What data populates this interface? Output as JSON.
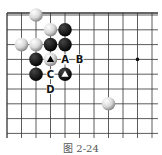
{
  "caption": "图 2-24",
  "board": {
    "origin_x": 7,
    "origin_y": 15,
    "spacing_x": 14.5,
    "spacing_y": 14.8,
    "cols": 11,
    "rows": 9,
    "left_edge": true,
    "top_edge": true,
    "line_color": "#333333",
    "hoshi": [
      {
        "col": 9,
        "row": 3
      }
    ]
  },
  "stones": [
    {
      "color": "white",
      "col": 2,
      "row": 0
    },
    {
      "color": "white",
      "col": 3,
      "row": 1
    },
    {
      "color": "black",
      "col": 4,
      "row": 1
    },
    {
      "color": "white",
      "col": 1,
      "row": 2
    },
    {
      "color": "white",
      "col": 2,
      "row": 2
    },
    {
      "color": "black",
      "col": 3,
      "row": 2
    },
    {
      "color": "black",
      "col": 4,
      "row": 2
    },
    {
      "color": "black",
      "col": 2,
      "row": 3
    },
    {
      "color": "white",
      "col": 3,
      "row": 3,
      "mark": "triangle"
    },
    {
      "color": "black",
      "col": 2,
      "row": 4
    },
    {
      "color": "black",
      "col": 4,
      "row": 4,
      "mark": "triangle"
    },
    {
      "color": "white",
      "col": 7,
      "row": 6
    }
  ],
  "labels": [
    {
      "text": "A",
      "col": 4,
      "row": 3
    },
    {
      "text": "B",
      "col": 5,
      "row": 3
    },
    {
      "text": "C",
      "col": 3,
      "row": 4
    },
    {
      "text": "D",
      "col": 3,
      "row": 5
    }
  ]
}
